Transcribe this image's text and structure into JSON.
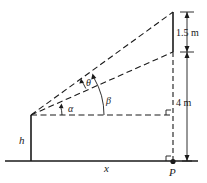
{
  "diagram": {
    "labels": {
      "height": "h",
      "distance": "x",
      "point": "P",
      "angle_alpha": "α",
      "angle_beta": "β",
      "angle_theta": "θ",
      "screen_height": "1.5 m",
      "screen_elevation": "4 m"
    }
  }
}
